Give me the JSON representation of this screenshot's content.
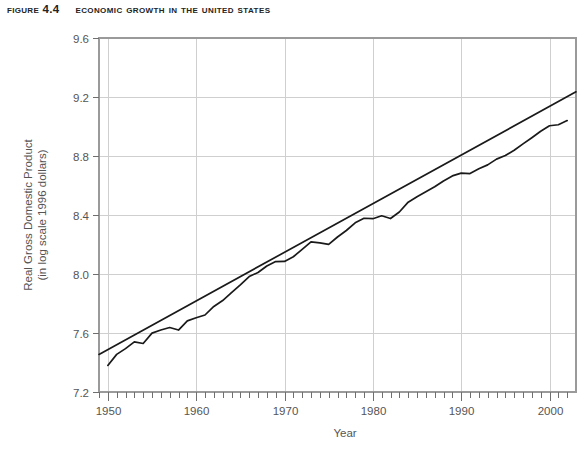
{
  "figure": {
    "number_label": "Figure 4.4",
    "caption": "Economic Growth in the United States"
  },
  "chart_data": {
    "type": "line",
    "title": "Economic Growth in the United States",
    "xlabel": "Year",
    "ylabel": "Real Gross Domestic Product",
    "ylabel_line2": "(in log scale 1996 dollars)",
    "xlim": [
      1949,
      2003
    ],
    "ylim": [
      7.2,
      9.6
    ],
    "xticks": [
      1950,
      1960,
      1970,
      1980,
      1990,
      2000
    ],
    "xtick_labels": [
      "1950",
      "1960",
      "1970",
      "1980",
      "1990",
      "2000"
    ],
    "minor_xtick_step": 1,
    "yticks": [
      7.2,
      7.6,
      8.0,
      8.4,
      8.8,
      9.2,
      9.6
    ],
    "ytick_labels": [
      "7.2",
      "7.6",
      "8.0",
      "8.4",
      "8.8",
      "9.2",
      "9.6"
    ],
    "grid": "major-both",
    "legend": "none",
    "series": [
      {
        "name": "Real GDP (log scale)",
        "color": "#1a1a1a",
        "type": "line",
        "x": [
          1950,
          1951,
          1952,
          1953,
          1954,
          1955,
          1956,
          1957,
          1958,
          1959,
          1960,
          1961,
          1962,
          1963,
          1964,
          1965,
          1966,
          1967,
          1968,
          1969,
          1970,
          1971,
          1972,
          1973,
          1974,
          1975,
          1976,
          1977,
          1978,
          1979,
          1980,
          1981,
          1982,
          1983,
          1984,
          1985,
          1986,
          1987,
          1988,
          1989,
          1990,
          1991,
          1992,
          1993,
          1994,
          1995,
          1996,
          1997,
          1998,
          1999,
          2000,
          2001,
          2002
        ],
        "y": [
          7.38,
          7.455,
          7.494,
          7.54,
          7.529,
          7.599,
          7.62,
          7.637,
          7.62,
          7.682,
          7.703,
          7.722,
          7.78,
          7.82,
          7.873,
          7.926,
          7.983,
          8.01,
          8.054,
          8.084,
          8.085,
          8.117,
          8.167,
          8.218,
          8.211,
          8.201,
          8.251,
          8.295,
          8.347,
          8.378,
          8.375,
          8.395,
          8.376,
          8.42,
          8.487,
          8.524,
          8.557,
          8.591,
          8.631,
          8.665,
          8.684,
          8.681,
          8.713,
          8.74,
          8.779,
          8.803,
          8.839,
          8.882,
          8.924,
          8.968,
          9.005,
          9.012,
          9.04
        ],
        "note": "Actual real GDP path with recession dips in 1958, 1974-75, 1980-82, 1991"
      },
      {
        "name": "Trend line",
        "color": "#1a1a1a",
        "type": "line",
        "x": [
          1949,
          2003
        ],
        "y": [
          7.455,
          9.235
        ],
        "note": "Straight fitted long-run growth trend"
      }
    ]
  },
  "axes": {
    "x_axis_title": "Year",
    "y_axis_title_line1": "Real Gross Domestic Product",
    "y_axis_title_line2": "(in log scale 1996 dollars)"
  },
  "colors": {
    "line": "#1a1a1a",
    "grid": "#cccccc",
    "frame": "#9a9a9a",
    "tick_text": "#555555",
    "title_text": "#242424"
  }
}
